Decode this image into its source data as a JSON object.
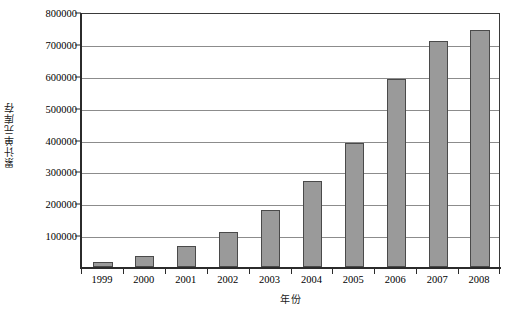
{
  "chart_data": {
    "type": "bar",
    "title": "",
    "xlabel": "年份",
    "ylabel": "累计单元库存",
    "categories": [
      "1999",
      "2000",
      "2001",
      "2002",
      "2003",
      "2004",
      "2005",
      "2006",
      "2007",
      "2008"
    ],
    "values": [
      15000,
      35000,
      65000,
      110000,
      180000,
      270000,
      390000,
      590000,
      710000,
      745000
    ],
    "series": [
      {
        "name": "累计单元库存",
        "values": [
          15000,
          35000,
          65000,
          110000,
          180000,
          270000,
          390000,
          590000,
          710000,
          745000
        ]
      }
    ],
    "ylim": [
      0,
      800000
    ],
    "y_ticks": [
      0,
      100000,
      200000,
      300000,
      400000,
      500000,
      600000,
      700000,
      800000
    ],
    "y_tick_labels": [
      "",
      "100000",
      "200000",
      "300000",
      "400000",
      "500000",
      "600000",
      "700000",
      "800000"
    ],
    "grid": true,
    "grid_axis": "y",
    "legend": false,
    "legend_position": "none",
    "bar_color": "#9a9a9a",
    "bar_edge_color": "#4a4a4a",
    "grid_color": "#8c8c8c",
    "axis_color": "#2b2b2b",
    "background_color": "#ffffff"
  }
}
